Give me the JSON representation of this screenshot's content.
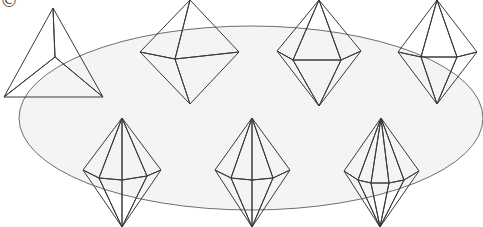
{
  "figure": {
    "corner_glyph": "©",
    "ellipse": {
      "cx": 251,
      "cy": 118,
      "rx": 232,
      "ry": 92,
      "stroke": "#6e6e6e",
      "fill": "#f4f4f4"
    },
    "shapes": [
      {
        "id": "tetrahedron",
        "label": "tetrahedron",
        "fill": "#6a6a6a",
        "top": [
          53,
          8
        ],
        "left": [
          4,
          97
        ],
        "right": [
          103,
          97
        ],
        "center": [
          55,
          57
        ]
      },
      {
        "id": "bipyramid-4",
        "label": "square bipyramid (octahedron)",
        "sides": 4,
        "fill": "#dcdcdc",
        "top": [
          190,
          0
        ],
        "bottom": [
          190,
          104
        ],
        "left": [
          140,
          52
        ],
        "right": [
          239,
          52
        ],
        "front": [
          [
            175,
            59
          ]
        ]
      },
      {
        "id": "bipyramid-5",
        "label": "pentagonal bipyramid",
        "sides": 5,
        "fill": "#b7b7b7",
        "top": [
          319,
          0
        ],
        "bottom": [
          319,
          106
        ],
        "left": [
          277,
          51
        ],
        "right": [
          361,
          51
        ],
        "front": [
          [
            293,
            60
          ],
          [
            341,
            60
          ]
        ]
      },
      {
        "id": "bipyramid-6",
        "label": "hexagonal bipyramid",
        "sides": 6,
        "fill": "#ececec",
        "top": [
          437,
          0
        ],
        "bottom": [
          437,
          104
        ],
        "left": [
          398,
          52
        ],
        "right": [
          477,
          52
        ],
        "front": [
          [
            421,
            57
          ],
          [
            457,
            57
          ]
        ]
      },
      {
        "id": "bipyramid-7",
        "label": "heptagonal bipyramid",
        "sides": 7,
        "fill": "#cfcfcf",
        "top": [
          122,
          118
        ],
        "bottom": [
          122,
          227
        ],
        "left": [
          83,
          170
        ],
        "right": [
          161,
          170
        ],
        "front": [
          [
            99,
            178
          ],
          [
            122,
            180
          ],
          [
            147,
            176
          ]
        ]
      },
      {
        "id": "bipyramid-8",
        "label": "octagonal bipyramid",
        "sides": 8,
        "fill": "#b5b5b5",
        "top": [
          252,
          118
        ],
        "bottom": [
          252,
          227
        ],
        "left": [
          215,
          170
        ],
        "right": [
          290,
          170
        ],
        "front": [
          [
            231,
            178
          ],
          [
            252,
            180
          ],
          [
            273,
            178
          ]
        ]
      },
      {
        "id": "bipyramid-9",
        "label": "enneagonal bipyramid",
        "sides": 9,
        "fill": "#9d9d9d",
        "top": [
          381,
          118
        ],
        "bottom": [
          380,
          227
        ],
        "left": [
          344,
          171
        ],
        "right": [
          419,
          171
        ],
        "front": [
          [
            358,
            180
          ],
          [
            371,
            183
          ],
          [
            389,
            183
          ],
          [
            404,
            180
          ]
        ]
      }
    ]
  }
}
